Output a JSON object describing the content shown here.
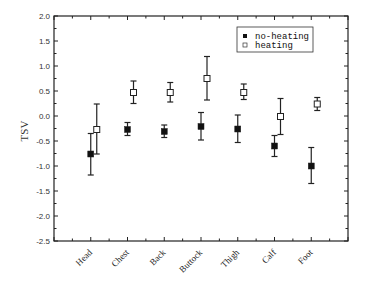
{
  "chart_data": {
    "type": "scatter",
    "subtype": "errorbar",
    "title": "",
    "xlabel": "",
    "ylabel": "TSV",
    "categories": [
      "Head",
      "Chest",
      "Back",
      "Buttock",
      "Thigh",
      "Calf",
      "Foot"
    ],
    "ylim": [
      -2.5,
      2.0
    ],
    "yticks": [
      2.0,
      1.5,
      1.0,
      0.5,
      0.0,
      -0.5,
      -1.0,
      -1.5,
      -2.0,
      -2.5
    ],
    "ytick_labels": [
      "2.0",
      "1.5",
      "1.0",
      "0.5",
      "0.0",
      "-0.5",
      "-1.0",
      "-1.5",
      "-2.0",
      "-2.5"
    ],
    "grid": false,
    "legend_position": "upper right",
    "series": [
      {
        "name": "no-heating",
        "marker": "filled-square",
        "values": [
          -0.76,
          -0.27,
          -0.31,
          -0.21,
          -0.26,
          -0.6,
          -1.0
        ],
        "error_upper": [
          -0.35,
          -0.13,
          -0.18,
          0.07,
          0.02,
          -0.39,
          -0.63
        ],
        "error_lower": [
          -1.18,
          -0.39,
          -0.43,
          -0.48,
          -0.53,
          -0.81,
          -1.35
        ]
      },
      {
        "name": "heating",
        "marker": "open-square",
        "values": [
          -0.27,
          0.47,
          0.47,
          0.75,
          0.47,
          -0.01,
          0.24
        ],
        "error_upper": [
          0.24,
          0.7,
          0.67,
          1.19,
          0.64,
          0.35,
          0.37
        ],
        "error_lower": [
          -0.76,
          0.25,
          0.28,
          0.32,
          0.33,
          -0.37,
          0.11
        ]
      }
    ]
  },
  "legend": {
    "items": [
      {
        "label": "no-heating",
        "marker": "filled-square"
      },
      {
        "label": "heating",
        "marker": "open-square"
      }
    ]
  },
  "colors": {
    "axis": "#222222",
    "marker": "#111111",
    "background": "#ffffff"
  }
}
